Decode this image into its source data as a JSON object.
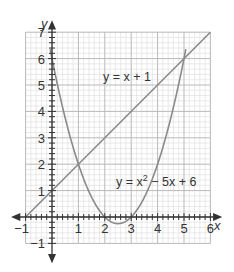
{
  "chart_data": {
    "type": "line",
    "title": "",
    "xlabel": "x",
    "ylabel": "y",
    "xlim": [
      -1,
      6
    ],
    "ylim": [
      -1,
      7
    ],
    "grid": true,
    "minor_grid_per_unit": 5,
    "x_ticks": [
      -1,
      1,
      2,
      3,
      4,
      5,
      6
    ],
    "y_ticks": [
      -1,
      1,
      2,
      3,
      4,
      5,
      6,
      7
    ],
    "x_tick_labels": [
      "−1",
      "1",
      "2",
      "3",
      "4",
      "5",
      "6"
    ],
    "y_tick_labels": [
      "−1",
      "1",
      "2",
      "3",
      "4",
      "5",
      "6",
      "7"
    ],
    "series": [
      {
        "name": "y = x + 1",
        "expression": "x + 1",
        "x": [
          -1,
          0,
          1,
          2,
          3,
          4,
          5,
          6
        ],
        "values": [
          0,
          1,
          2,
          3,
          4,
          5,
          6,
          7
        ]
      },
      {
        "name": "y = x² − 5x + 6",
        "expression": "x^2 - 5x + 6",
        "x": [
          -0.1,
          0,
          1,
          2,
          2.5,
          3,
          4,
          5,
          5.1
        ],
        "values": [
          6.51,
          6,
          2,
          0,
          -0.25,
          0,
          2,
          6,
          6.51
        ]
      }
    ],
    "intersections": [
      [
        1,
        2
      ],
      [
        5,
        6
      ]
    ],
    "annotations": [
      {
        "text": "y = x + 1",
        "x": 2,
        "y": 4.9
      },
      {
        "text": "y = x² − 5x + 6",
        "x": 2.5,
        "y": 1.3
      }
    ],
    "colors": {
      "curve": "#8a8a8a",
      "axis": "#333333",
      "major_grid": "#b9b9b9",
      "minor_grid": "#dcdcdc"
    }
  },
  "labels": {
    "x_axis": "x",
    "y_axis": "y",
    "line_label_prefix": "y = x + 1",
    "parabola_label_a": "y = x",
    "parabola_label_sup": "2",
    "parabola_label_b": " − 5x + 6"
  }
}
